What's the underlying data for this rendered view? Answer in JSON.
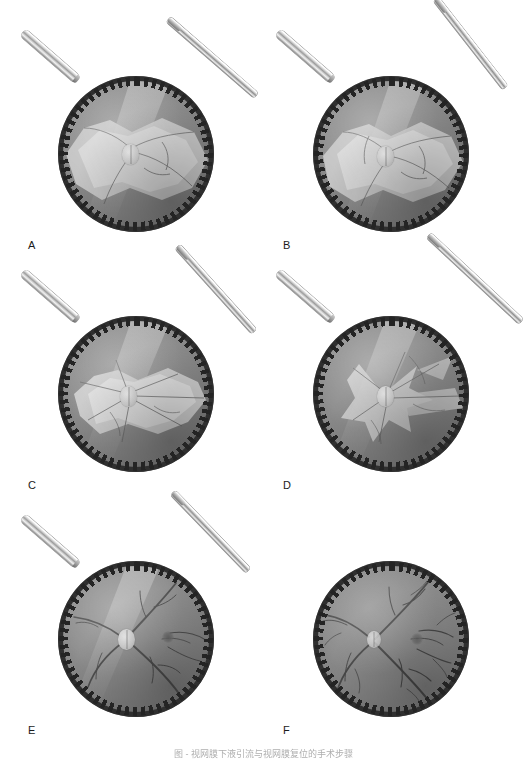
{
  "figure": {
    "label_a": "A",
    "label_b": "B",
    "label_c": "C",
    "label_d": "D",
    "label_e": "E",
    "label_f": "F",
    "caption": "图 -  视网膜下液引流与视网膜复位的手术步骤",
    "panel_count": 6,
    "rendering": "grayscale medical illustration",
    "colors": {
      "page_background": "#ffffff",
      "fundus_mid": "#8d8d8d",
      "fundus_dark": "#6d6d6d",
      "ora_serrata_rim": "#2f2f2f",
      "detached_retina": "#c9c9c9",
      "detached_retina_bright": "#dedede",
      "vessel": "#4c4c4c",
      "optic_disc": "#e8e8e8",
      "instrument_highlight": "#ffffff",
      "instrument_shadow": "#6b6b6b",
      "label_text": "#1b1b1b"
    }
  },
  "panels": [
    {
      "id": "a",
      "label": "A",
      "description": "Bullous retinal detachment with large elevated retinal sheet; cannula introduced from upper right toward optic disc.",
      "detachment_extent": "large",
      "corner_instrument": true,
      "instrument_in_eye": true,
      "instrument_angle_deg": 41,
      "optic_disc_visible": true,
      "macula_visible": false
    },
    {
      "id": "b",
      "label": "B",
      "description": "Cannula advanced at steeper angle; detached retina still broadly elevated with folds.",
      "detachment_extent": "large",
      "corner_instrument": true,
      "instrument_in_eye": true,
      "instrument_angle_deg": 52,
      "optic_disc_visible": true,
      "macula_visible": false
    },
    {
      "id": "c",
      "label": "C",
      "description": "Subretinal fluid drainage begins; detachment flattening, radial retinal folds converge on the disc.",
      "detachment_extent": "moderate",
      "corner_instrument": true,
      "instrument_in_eye": true,
      "instrument_angle_deg": 48,
      "optic_disc_visible": true,
      "macula_visible": false
    },
    {
      "id": "d",
      "label": "D",
      "description": "Detachment substantially reduced to star-shaped residual folds around the optic disc; vessels reappear.",
      "detachment_extent": "small",
      "corner_instrument": true,
      "instrument_in_eye": true,
      "instrument_angle_deg": 43,
      "optic_disc_visible": true,
      "macula_visible": false
    },
    {
      "id": "e",
      "label": "E",
      "description": "Retina nearly fully reattached; optic disc and full vascular arcades visible, cannula tip still in the vitreous cavity.",
      "detachment_extent": "none",
      "corner_instrument": true,
      "instrument_in_eye": true,
      "instrument_angle_deg": 46,
      "optic_disc_visible": true,
      "macula_visible": true
    },
    {
      "id": "f",
      "label": "F",
      "description": "Final result: completely reattached flat retina with normal vessel tree, optic disc and macula; no instruments.",
      "detachment_extent": "none",
      "corner_instrument": false,
      "instrument_in_eye": false,
      "instrument_angle_deg": 0,
      "optic_disc_visible": true,
      "macula_visible": true
    }
  ]
}
